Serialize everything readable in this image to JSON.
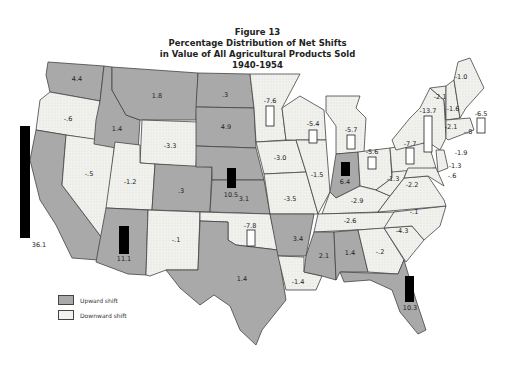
{
  "figure": {
    "number": "Figure 13",
    "title_line1": "Percentage Distribution of Net Shifts",
    "title_line2": "in Value of All Agricultural Products Sold",
    "years": "1940-1954"
  },
  "legend": {
    "upward_label": "Upward shift",
    "downward_label": "Downward shift",
    "upward_color": "#a9a9a9",
    "downward_color": "#f1f1ee"
  },
  "colors": {
    "up": "#a9a9a9",
    "down": "#f1f1ee",
    "border": "#444444",
    "bar": "#000000"
  },
  "states": [
    {
      "name": "Washington",
      "value": "4.4",
      "shift": "up"
    },
    {
      "name": "Oregon",
      "value": "-.6",
      "shift": "down"
    },
    {
      "name": "California",
      "value": "36.1",
      "shift": "up",
      "bar": true
    },
    {
      "name": "Nevada",
      "value": "-.5",
      "shift": "down"
    },
    {
      "name": "Idaho",
      "value": "1.4",
      "shift": "up"
    },
    {
      "name": "Montana",
      "value": "1.8",
      "shift": "up"
    },
    {
      "name": "Wyoming",
      "value": "-3.3",
      "shift": "down"
    },
    {
      "name": "Utah",
      "value": "-1.2",
      "shift": "down"
    },
    {
      "name": "Colorado",
      "value": ".3",
      "shift": "up"
    },
    {
      "name": "Arizona",
      "value": "11.1",
      "shift": "up",
      "bar": true
    },
    {
      "name": "New Mexico",
      "value": "-.1",
      "shift": "down"
    },
    {
      "name": "North Dakota",
      "value": ".3",
      "shift": "up"
    },
    {
      "name": "South Dakota",
      "value": "4.9",
      "shift": "up"
    },
    {
      "name": "Nebraska",
      "value": "10.5",
      "shift": "up",
      "bar": true
    },
    {
      "name": "Kansas",
      "value": "3.1",
      "shift": "up"
    },
    {
      "name": "Oklahoma",
      "value": "-7.8",
      "shift": "down",
      "bar": true
    },
    {
      "name": "Texas",
      "value": "1.4",
      "shift": "up"
    },
    {
      "name": "Minnesota",
      "value": "-7.6",
      "shift": "down",
      "bar": true
    },
    {
      "name": "Iowa",
      "value": "-3.0",
      "shift": "down"
    },
    {
      "name": "Missouri",
      "value": "-3.5",
      "shift": "down"
    },
    {
      "name": "Arkansas",
      "value": "3.4",
      "shift": "up"
    },
    {
      "name": "Louisiana",
      "value": "-1.4",
      "shift": "down"
    },
    {
      "name": "Wisconsin",
      "value": "-5.4",
      "shift": "down",
      "bar": true
    },
    {
      "name": "Illinois",
      "value": "-1.5",
      "shift": "down"
    },
    {
      "name": "Michigan",
      "value": "-5.7",
      "shift": "down",
      "bar": true
    },
    {
      "name": "Indiana",
      "value": "6.4",
      "shift": "up",
      "bar": true
    },
    {
      "name": "Ohio",
      "value": "-5.6",
      "shift": "down",
      "bar": true
    },
    {
      "name": "Kentucky",
      "value": "-2.9",
      "shift": "down"
    },
    {
      "name": "Tennessee",
      "value": "-2.6",
      "shift": "down"
    },
    {
      "name": "Mississippi",
      "value": "2.1",
      "shift": "up"
    },
    {
      "name": "Alabama",
      "value": "1.4",
      "shift": "up"
    },
    {
      "name": "Georgia",
      "value": "-.2",
      "shift": "down"
    },
    {
      "name": "Florida",
      "value": "10.3",
      "shift": "up",
      "bar": true
    },
    {
      "name": "South Carolina",
      "value": "-4.3",
      "shift": "down"
    },
    {
      "name": "North Carolina",
      "value": "-.1",
      "shift": "down"
    },
    {
      "name": "Virginia",
      "value": "-2.2",
      "shift": "down"
    },
    {
      "name": "West Virginia",
      "value": "-1.3",
      "shift": "down"
    },
    {
      "name": "Pennsylvania",
      "value": "-7.7",
      "shift": "down",
      "bar": true
    },
    {
      "name": "New York",
      "value": "-13.7",
      "shift": "down",
      "bar": true
    },
    {
      "name": "Vermont",
      "value": "-2.1",
      "shift": "down"
    },
    {
      "name": "New Hampshire",
      "value": "-1.6",
      "shift": "down"
    },
    {
      "name": "Maine",
      "value": "-1.0",
      "shift": "down"
    },
    {
      "name": "Massachusetts",
      "value": "-6.5",
      "shift": "down",
      "bar": true
    },
    {
      "name": "Connecticut",
      "value": "-2.1",
      "shift": "down"
    },
    {
      "name": "Rhode Island",
      "value": "-.8",
      "shift": "down"
    },
    {
      "name": "New Jersey",
      "value": "-1.9",
      "shift": "down"
    },
    {
      "name": "Delaware",
      "value": "-1.3",
      "shift": "down"
    },
    {
      "name": "Maryland",
      "value": "-.6",
      "shift": "down"
    }
  ]
}
